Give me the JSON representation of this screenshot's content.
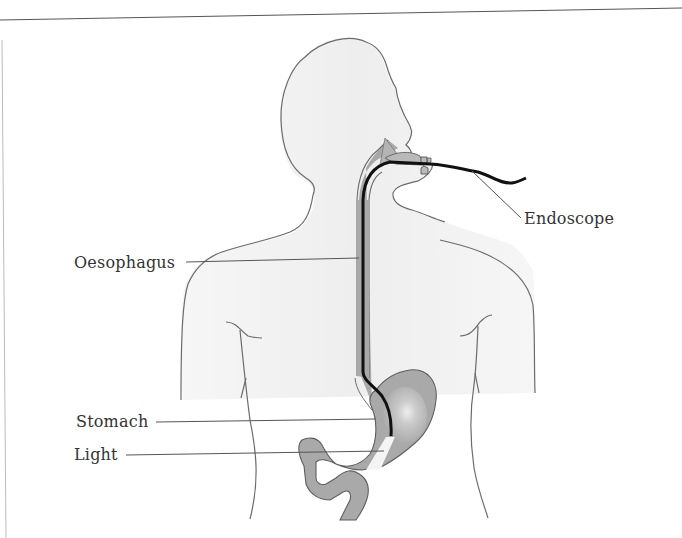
{
  "diagram": {
    "type": "anatomical illustration",
    "labels": [
      {
        "id": "endoscope",
        "text": "Endoscope"
      },
      {
        "id": "oesophagus",
        "text": "Oesophagus"
      },
      {
        "id": "stomach",
        "text": "Stomach"
      },
      {
        "id": "light",
        "text": "Light"
      }
    ],
    "colors": {
      "outline": "#6b6b6b",
      "body_fill": "#f4f4f4",
      "organ_fill": "#a9a9a9",
      "endoscope": "#111111",
      "leader_line": "#555555",
      "text": "#333333"
    }
  }
}
